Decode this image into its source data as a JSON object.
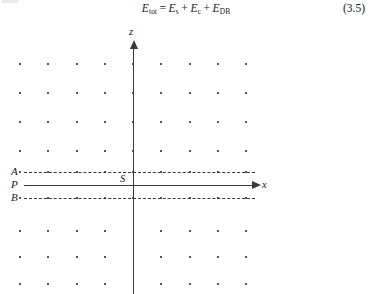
{
  "equation": {
    "lhs": "E",
    "lhs_sub": "tot",
    "eq_sign": "=",
    "terms": [
      {
        "symbol": "E",
        "sub": "s"
      },
      {
        "symbol": "E",
        "sub": "c"
      },
      {
        "symbol": "E",
        "sub": "DB"
      }
    ],
    "plus": "+",
    "number": "(3.5)",
    "plain_text": "E_tot = E_s + E_c + E_DB"
  },
  "figure": {
    "axis_labels": {
      "vertical": "z",
      "horizontal": "x"
    },
    "point_labels": {
      "origin": "S",
      "line_a": "A",
      "line_p": "P",
      "line_b": "B"
    },
    "colors": {
      "ink": "#1f1f1f",
      "line": "#3a3a3a",
      "background": "#ffffff"
    },
    "geometry": {
      "origin_x": 133,
      "x_axis_y": 161,
      "line_a_y": 148,
      "line_b_y": 174,
      "column_start_x": 20,
      "column_spacing": 28.3,
      "column_count": 9,
      "dot_radius": 1.1
    },
    "lattice": {
      "description": "regular rectangular dot lattice, 9 columns",
      "columns_x": [
        20,
        48,
        77,
        105,
        133,
        161,
        190,
        218,
        246
      ],
      "rows_above_axis_y": [
        40,
        69,
        98,
        127
      ],
      "row_on_line_a_y": 148,
      "row_on_line_b_y": 174,
      "rows_below_axis_y": [
        207,
        233,
        260
      ],
      "center_column_index": 4,
      "rows_below_skip_center": true
    },
    "line_styles": {
      "line_a": "dashed",
      "line_p": "solid",
      "line_b": "dashed",
      "z_axis": "solid-arrow",
      "x_axis": "solid-arrow"
    }
  }
}
